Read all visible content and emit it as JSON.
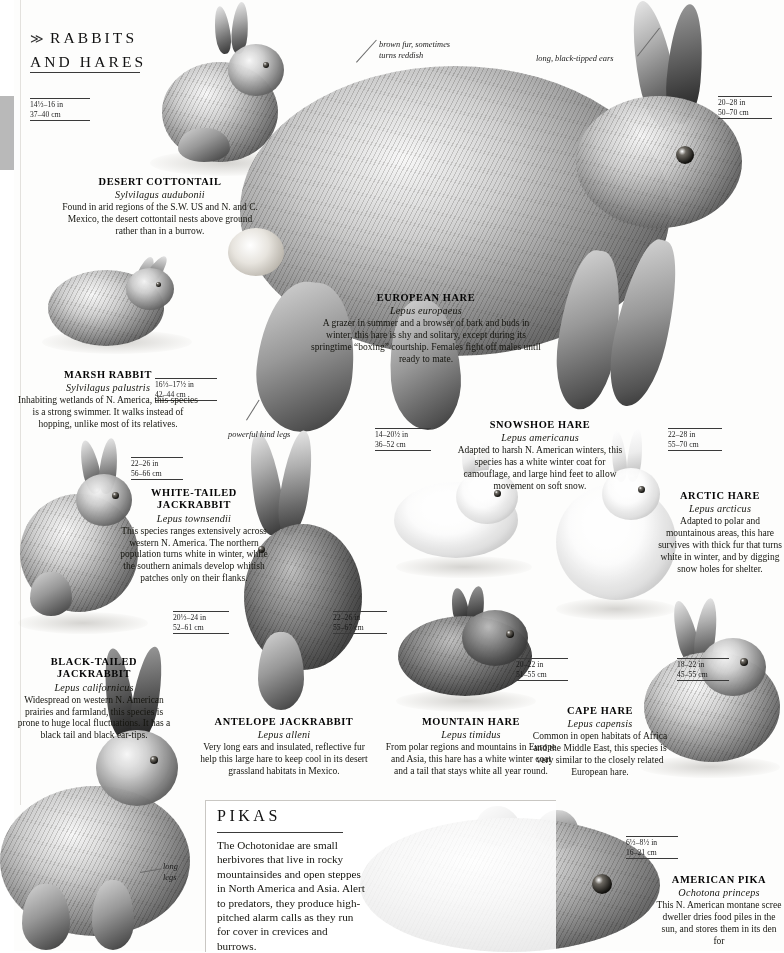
{
  "page": {
    "sections": [
      {
        "id": "rabbits",
        "chevron": "≫",
        "title_line1": "RABBITS",
        "title_line2": "AND HARES"
      },
      {
        "id": "pikas",
        "title": "PIKAS",
        "body": "The Ochotonidae are small herbivores that live in rocky mountainsides and open steppes in North America and Asia. Alert to predators, they produce high-pitched alarm calls as they run for cover in crevices and burrows."
      }
    ]
  },
  "species": [
    {
      "name": "DESERT COTTONTAIL",
      "scientific": "Sylvilagus audubonii",
      "description": "Found in arid regions of the S.W. US and N. and C. Mexico, the desert cottontail nests above ground rather than in a burrow.",
      "measure_in": "14½–16 in",
      "measure_cm": "37–40 cm"
    },
    {
      "name": "MARSH RABBIT",
      "scientific": "Sylvilagus palustris",
      "description": "Inhabiting wetlands of N. America, this species is a strong swimmer. It walks instead of hopping, unlike most of its relatives.",
      "measure_in": "16½–17½ in",
      "measure_cm": "42–44 cm"
    },
    {
      "name": "EUROPEAN HARE",
      "scientific": "Lepus europaeus",
      "description": "A grazer in summer and a browser of bark and buds in winter, this hare is shy and solitary, except during its springtime “boxing” courtship. Females fight off males until ready to mate.",
      "measure_in": "20–28 in",
      "measure_cm": "50–70 cm"
    },
    {
      "name": "WHITE-TAILED JACKRABBIT",
      "scientific": "Lepus townsendii",
      "description": "This species ranges extensively across western N. America. The northern population turns white in winter, while the southern animals develop whitish patches only on their flanks.",
      "measure_in": "22–26 in",
      "measure_cm": "56–66 cm"
    },
    {
      "name": "SNOWSHOE HARE",
      "scientific": "Lepus americanus",
      "description": "Adapted to harsh N. American winters, this species has a white winter coat for camouflage, and large hind feet to allow movement on soft snow.",
      "measure_in": "14–20½ in",
      "measure_cm": "36–52 cm"
    },
    {
      "name": "ARCTIC HARE",
      "scientific": "Lepus arcticus",
      "description": "Adapted to polar and mountainous areas, this hare survives with thick fur that turns white in winter, and by digging snow holes for shelter.",
      "measure_in": "22–28 in",
      "measure_cm": "55–70 cm"
    },
    {
      "name": "BLACK-TAILED JACKRABBIT",
      "scientific": "Lepus californicus",
      "description": "Widespread on western N. American prairies and farmland, this species is prone to huge local fluctuations. It has a black tail and black ear-tips.",
      "measure_in": "20½–24 in",
      "measure_cm": "52–61 cm"
    },
    {
      "name": "ANTELOPE JACKRABBIT",
      "scientific": "Lepus alleni",
      "description": "Very long ears and insulated, reflective fur help this large hare to keep cool in its desert grassland habitats in Mexico.",
      "measure_in": "22–26 in",
      "measure_cm": "55–67 cm"
    },
    {
      "name": "MOUNTAIN HARE",
      "scientific": "Lepus timidus",
      "description": "From polar regions and mountains in Europe and Asia, this hare has a white winter coat and a tail that stays white all year round.",
      "measure_in": "20–22 in",
      "measure_cm": "51–55 cm"
    },
    {
      "name": "CAPE HARE",
      "scientific": "Lepus capensis",
      "description": "Common in open habitats of Africa and the Middle East, this species is very similar to the closely related European hare.",
      "measure_in": "18–22 in",
      "measure_cm": "45–55 cm"
    },
    {
      "name": "AMERICAN PIKA",
      "scientific": "Ochotona princeps",
      "description": "This N. American montane scree dweller dries food piles in the sun, and stores them in its den for",
      "measure_in": "6½–8½ in",
      "measure_cm": "16–21 cm"
    }
  ],
  "annotations": [
    {
      "text_line1": "brown fur, sometimes",
      "text_line2": "turns reddish"
    },
    {
      "text_line1": "long, black-tipped ears",
      "text_line2": ""
    },
    {
      "text_line1": "powerful hind legs",
      "text_line2": ""
    },
    {
      "text_line1": "long",
      "text_line2": "legs"
    }
  ]
}
